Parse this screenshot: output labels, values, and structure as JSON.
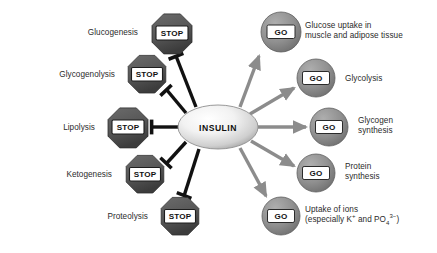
{
  "diagram": {
    "center": {
      "label": "INSULIN",
      "shape": "ellipse",
      "cx": 218,
      "cy": 127,
      "rx": 40,
      "ry": 22
    },
    "colors": {
      "background": "#ffffff",
      "inhibit_arrow": "#111111",
      "stimulate_arrow": "#8c8c8c",
      "stop_octagon": "#5a5a5a",
      "stop_octagon_dark": "#3d3d3d",
      "go_circle": "#8e8e8e",
      "go_circle_dark": "#6e6e6e",
      "node_label_box": "#ffffff",
      "text": "#2b2b2b"
    },
    "inhibited": {
      "badge": "STOP",
      "arrow_type": "inhibition-tbar",
      "items": [
        {
          "label": "Glucogenesis",
          "label_x": 138,
          "label_y": 32,
          "node_cx": 172,
          "node_cy": 33,
          "r": 20
        },
        {
          "label": "Glycogenolysis",
          "label_x": 115,
          "label_y": 74,
          "node_cx": 147,
          "node_cy": 74,
          "r": 19
        },
        {
          "label": "Lipolysis",
          "label_x": 95,
          "label_y": 127,
          "node_cx": 128,
          "node_cy": 127,
          "r": 20
        },
        {
          "label": "Ketogenesis",
          "label_x": 112,
          "label_y": 174,
          "node_cx": 145,
          "node_cy": 174,
          "r": 19
        },
        {
          "label": "Proteolysis",
          "label_x": 148,
          "label_y": 216,
          "node_cx": 180,
          "node_cy": 216,
          "r": 19
        }
      ]
    },
    "stimulated": {
      "badge": "GO",
      "arrow_type": "stimulation-arrow",
      "items": [
        {
          "label": "Glucose uptake in\nmuscle and adipose tissue",
          "lines": [
            "Glucose uptake in",
            "muscle and adipose tissue"
          ],
          "label_x": 305,
          "label_y": 25,
          "node_cx": 281,
          "node_cy": 32,
          "r": 20
        },
        {
          "label": "Glycolysis",
          "lines": [
            "Glycolysis"
          ],
          "label_x": 345,
          "label_y": 78,
          "node_cx": 316,
          "node_cy": 78,
          "r": 19
        },
        {
          "label": "Glycogen\nsynthesis",
          "lines": [
            "Glycogen",
            "synthesis"
          ],
          "label_x": 358,
          "label_y": 120,
          "node_cx": 329,
          "node_cy": 127,
          "r": 19
        },
        {
          "label": "Protein\nsynthesis",
          "lines": [
            "Protein",
            "synthesis"
          ],
          "label_x": 345,
          "label_y": 166,
          "node_cx": 316,
          "node_cy": 173,
          "r": 19
        },
        {
          "label": "Uptake of ions\n(especially K+ and PO43-)",
          "lines": [
            "Uptake of ions",
            "(especially K+ and PO4 3-)"
          ],
          "label_x": 305,
          "label_y": 209,
          "node_cx": 281,
          "node_cy": 216,
          "r": 19
        }
      ]
    },
    "ion_label": {
      "line1": "Uptake of ions",
      "prefix": "(especially K",
      "k_sup": "+",
      "mid": " and PO",
      "po_sub": "4",
      "po_sup": "3−",
      "suffix": ")"
    }
  }
}
